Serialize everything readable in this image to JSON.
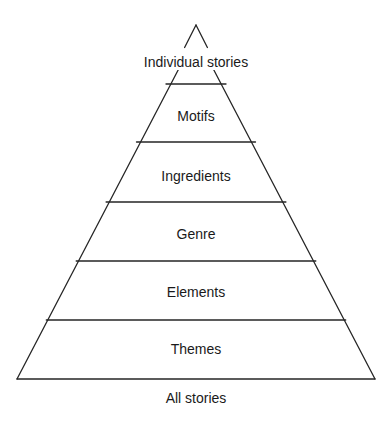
{
  "diagram": {
    "type": "pyramid",
    "title": "",
    "orientation": "apex-up",
    "tier_count": 6,
    "line_color": "#262626",
    "text_color": "#1a1a1a",
    "background_color": "#ffffff",
    "tiers": [
      {
        "label": "Individual stories",
        "level": 1,
        "position": "apex"
      },
      {
        "label": "Motifs",
        "level": 2,
        "position": "upper"
      },
      {
        "label": "Ingredients",
        "level": 3,
        "position": "upper-middle"
      },
      {
        "label": "Genre",
        "level": 4,
        "position": "middle"
      },
      {
        "label": "Elements",
        "level": 5,
        "position": "lower-middle"
      },
      {
        "label": "Themes",
        "level": 6,
        "position": "base"
      }
    ],
    "base_caption": "All stories"
  }
}
